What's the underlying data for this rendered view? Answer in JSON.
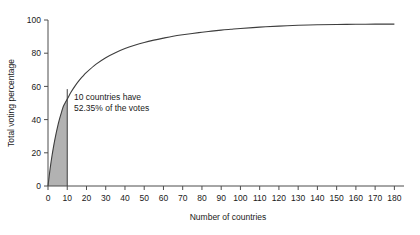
{
  "chart_data": {
    "type": "line",
    "title": "",
    "xlabel": "Number of countries",
    "ylabel": "Total voting percentage",
    "xlim": [
      0,
      185
    ],
    "ylim": [
      0,
      100
    ],
    "grid": false,
    "legend": null,
    "x_ticks": [
      0,
      10,
      20,
      30,
      40,
      50,
      60,
      70,
      80,
      90,
      100,
      110,
      120,
      130,
      140,
      150,
      160,
      170,
      180
    ],
    "y_ticks": [
      0,
      20,
      40,
      60,
      80,
      100
    ],
    "series": [
      {
        "name": "Cumulative voting percentage",
        "x": [
          0,
          1,
          2,
          3,
          4,
          5,
          6,
          7,
          8,
          9,
          10,
          12,
          14,
          16,
          18,
          20,
          25,
          30,
          35,
          40,
          45,
          50,
          55,
          60,
          65,
          70,
          75,
          80,
          85,
          90,
          95,
          100,
          110,
          120,
          130,
          140,
          150,
          160,
          170,
          180
        ],
        "values": [
          0,
          9.5,
          17.6,
          24.5,
          30.5,
          35.8,
          40.4,
          44.4,
          48.0,
          50.3,
          52.35,
          56.6,
          60.2,
          63.3,
          66.0,
          68.4,
          73.4,
          77.3,
          80.3,
          82.8,
          84.8,
          86.5,
          87.9,
          89.1,
          90.2,
          91.1,
          91.9,
          92.6,
          93.3,
          93.9,
          94.4,
          94.9,
          95.7,
          96.3,
          96.8,
          97.1,
          97.3,
          97.4,
          97.5,
          97.5
        ]
      }
    ],
    "shaded_region": {
      "x_start": 0,
      "x_end": 10,
      "color": "#b2b2b2",
      "label": "10 countries have 52.35% of the votes"
    },
    "annotations": [
      {
        "name": "highlight-callout",
        "line1": "10 countries have",
        "line2": "52.35% of the votes",
        "x": 14,
        "y": 52.35
      }
    ]
  },
  "colors": {
    "curve": "#3d3d3d",
    "axis": "#4d4d4d",
    "shade": "#b2b2b2",
    "background": "#ffffff"
  }
}
